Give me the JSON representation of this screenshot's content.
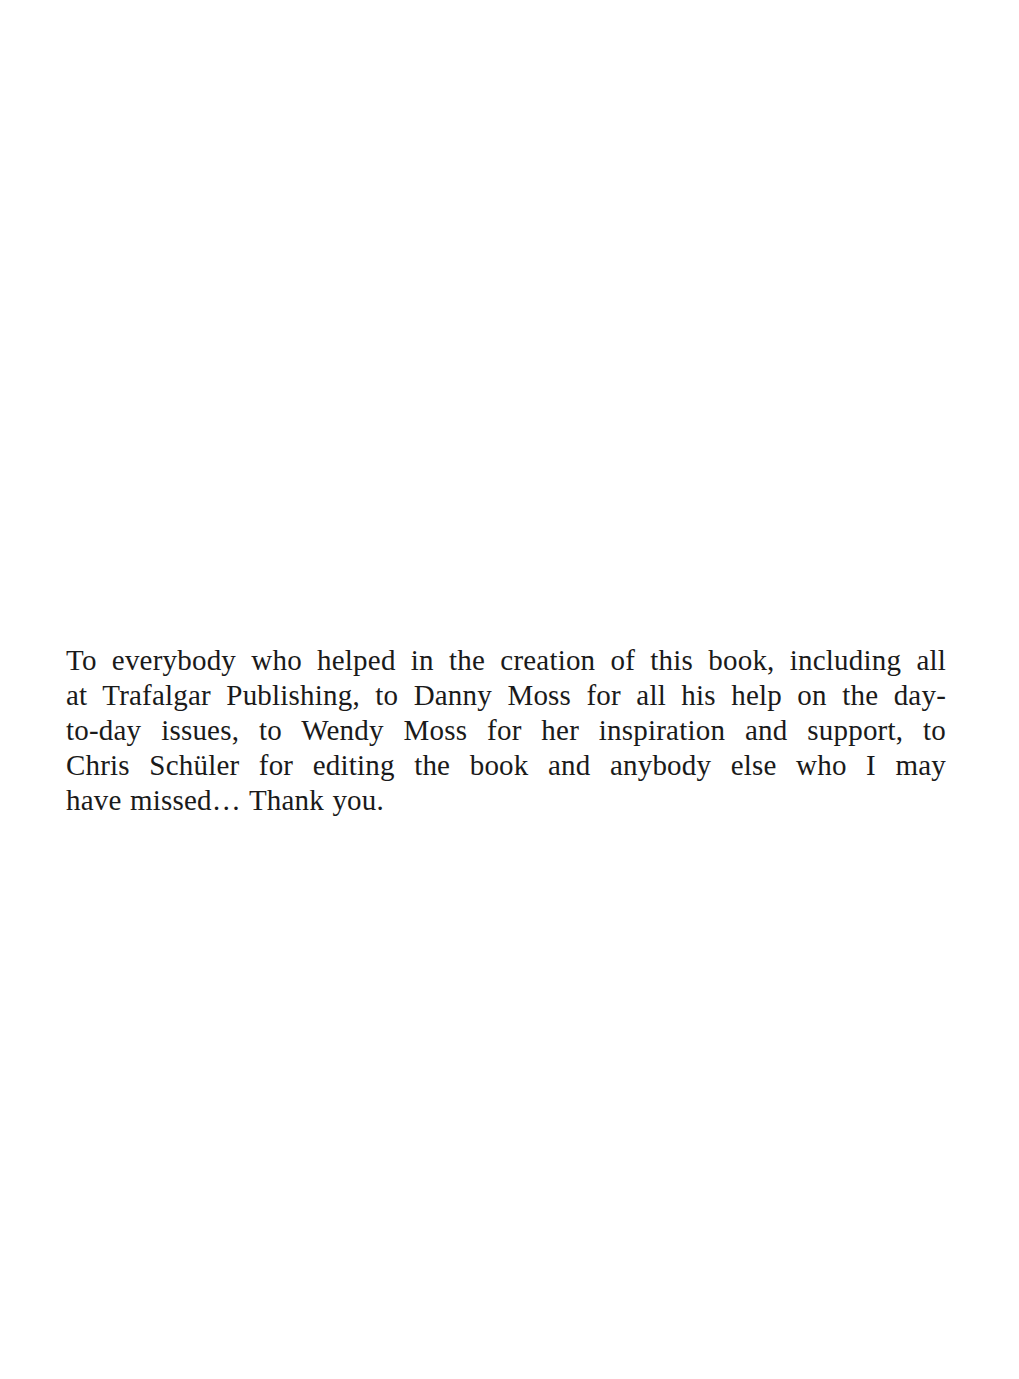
{
  "document": {
    "type": "acknowledgements-page",
    "paragraph": {
      "full_text": "To everybody who helped in the creation of this book, including all at Trafalgar Publishing, to Danny Moss for all his help on the day-to-day issues, to Wendy Moss for her inspiration and support, to Chris Schüler for editing the book and anybody else who I may have missed… Thank you.",
      "lines": [
        "To everybody who helped in the creation of this book, including all",
        "at Trafalgar Publishing, to Danny Moss for all his help on the day-",
        "to-day issues, to Wendy Moss for her inspiration and support, to",
        "Chris Schüler for editing the book and anybody else who I may",
        "have missed… Thank you."
      ]
    }
  }
}
